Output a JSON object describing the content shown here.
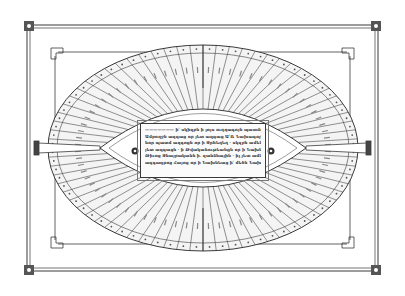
{
  "figure": {
    "colors": {
      "ink": "#3a3a3a",
      "paper": "#ffffff",
      "light_ink": "#8a8a8a"
    },
    "ring": {
      "segments_per_half": 36,
      "has_dotted_outer_band": true
    },
    "central_panel": {
      "script": "Armenian",
      "lines": [
        "——————— ի՛ սկիզբն ի լոյս ուղղագոյն պատմութեան · ի՛ ցուց ետ",
        "Ամբողջն ազգաց որ յետ ազգաց Ա՛Ռ Նախագոյն · ետ յաղագս",
        "նոր պատմ ազգոցն որ ի Ջրհեղեղ · սկզբն ամենայնոյ ազգացն",
        "յետ ազգացն · ի Թվականութեանցն որ ի Նախնեաց արարչութեան ի",
        "Թիւոց Ջնայրականն ի. զանձնային · իլ յետ ամենայնն յետ",
        "ազգագրոց Հայոց որ ի Նախնեաց ի՛ մեծն Նախագոյն ·"
      ]
    },
    "pointers": {
      "left_label": "Թվական ազգաց",
      "right_label": "Թվական ազգաց"
    }
  }
}
